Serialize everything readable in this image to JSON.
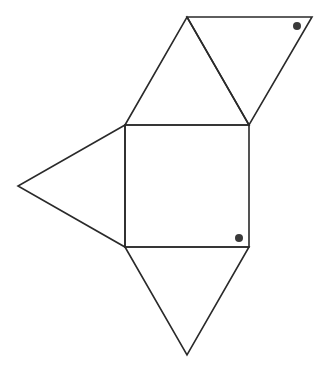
{
  "diagram": {
    "colors": {
      "line": "#2a2a2a",
      "dot": "#3a3a3a",
      "background": "#ffffff"
    },
    "shapes": {
      "square": [
        [
          125,
          125
        ],
        [
          249,
          125
        ],
        [
          249,
          247
        ],
        [
          125,
          247
        ]
      ],
      "top_triangle": [
        [
          125,
          125
        ],
        [
          187,
          17
        ],
        [
          249,
          125
        ]
      ],
      "upper_right_triangle": [
        [
          187,
          17
        ],
        [
          312,
          17
        ],
        [
          249,
          125
        ]
      ],
      "left_triangle": [
        [
          125,
          125
        ],
        [
          18,
          186
        ],
        [
          125,
          247
        ]
      ],
      "bottom_triangle": [
        [
          125,
          247
        ],
        [
          187,
          355
        ],
        [
          249,
          247
        ]
      ]
    },
    "dots": [
      {
        "name": "dot-upper-right-triangle",
        "x": 297,
        "y": 26,
        "r": 4
      },
      {
        "name": "dot-square",
        "x": 239,
        "y": 238,
        "r": 4
      }
    ]
  }
}
